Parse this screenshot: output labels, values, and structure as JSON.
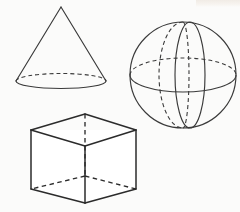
{
  "figure": {
    "background_color": "#fbfbfa",
    "line_color": "#2b2b2b",
    "canvas": {
      "width": 240,
      "height": 212
    },
    "shapes": [
      {
        "id": "cone",
        "name": "Cone",
        "apex": {
          "x": 61,
          "y": 7
        },
        "base_center": {
          "x": 61,
          "y": 81
        },
        "base_radius_x": 45,
        "base_radius_y": 7.5,
        "hidden_edges": "back half of base ellipse",
        "visible_edges": "two slant lines and front half of base ellipse"
      },
      {
        "id": "sphere",
        "name": "Sphere",
        "center": {
          "x": 183,
          "y": 75
        },
        "radius": 53,
        "equator": {
          "radius_x": 53,
          "radius_y": 17
        },
        "meridian_solid": {
          "radius_x": 15,
          "radius_y": 53
        },
        "meridian_hidden": {
          "radius_x": 23,
          "radius_y": 53
        },
        "hidden_edges": "back half of equator and the rear meridian"
      },
      {
        "id": "cube",
        "name": "Cube",
        "front_top_left": {
          "x": 31,
          "y": 130
        },
        "front_top_right": {
          "x": 136,
          "y": 130
        },
        "back_top": {
          "x": 85,
          "y": 114
        },
        "front_bottom_left": {
          "x": 31,
          "y": 189
        },
        "front_bottom_right": {
          "x": 136,
          "y": 189
        },
        "front_bottom_center": {
          "x": 85,
          "y": 203
        },
        "back_bottom": {
          "x": 85,
          "y": 176
        },
        "hidden_edges": "three edges meeting at the rear-bottom vertex"
      }
    ]
  }
}
